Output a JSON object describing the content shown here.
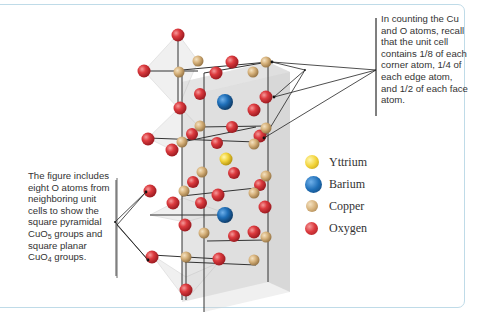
{
  "figure": {
    "callout_top": "In counting the Cu and O atoms, recall that the unit cell contains 1/8 of each corner atom, 1/4 of each edge atom, and 1/2 of each face atom.",
    "callout_left_parts": {
      "p1": "The figure includes eight O atoms from neighboring unit cells to show the square pyramidal CuO",
      "sub1": "5",
      "p2": " groups and square planar CuO",
      "sub2": "4",
      "p3": " groups."
    },
    "legend": [
      {
        "label": "Yttrium",
        "color": "#f2d33a",
        "icon": "yttrium-atom-icon"
      },
      {
        "label": "Barium",
        "color": "#1f6fb8",
        "icon": "barium-atom-icon"
      },
      {
        "label": "Copper",
        "color": "#d8b680",
        "icon": "copper-atom-icon"
      },
      {
        "label": "Oxygen",
        "color": "#d9363b",
        "icon": "oxygen-atom-icon"
      }
    ],
    "colors": {
      "frame_border": "#bfdbe8",
      "cell_fill": "#d9d9d9",
      "bond": "#333333"
    }
  }
}
